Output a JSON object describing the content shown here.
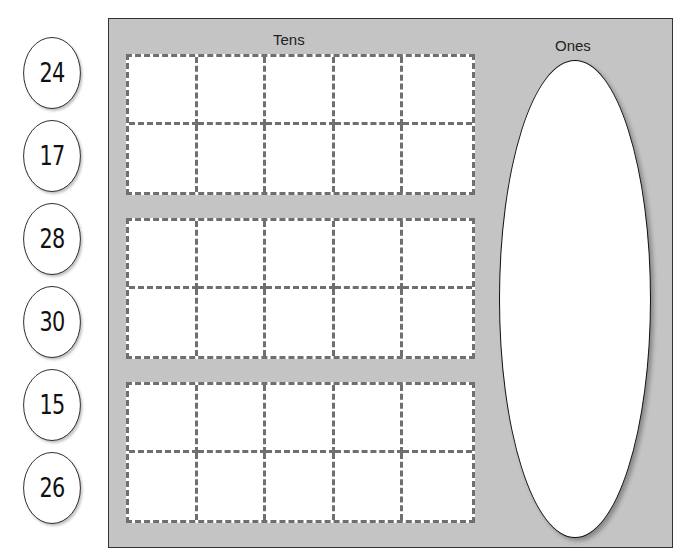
{
  "numbers": [
    "24",
    "17",
    "28",
    "30",
    "15",
    "26"
  ],
  "panel": {
    "tens_label": "Tens",
    "ones_label": "Ones",
    "ten_frames_count": 3,
    "cells_per_frame": 10
  },
  "colors": {
    "panel_bg": "#c4c4c4",
    "dash": "#6f6f6f",
    "card_bg": "#ffffff"
  }
}
